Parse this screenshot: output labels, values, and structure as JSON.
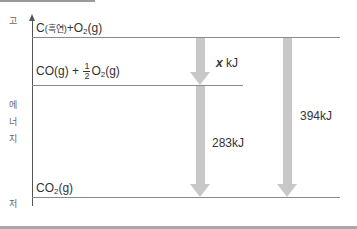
{
  "diagram": {
    "type": "energy_level_diagram",
    "y_axis": {
      "high_label": "고",
      "middle_label": [
        "에",
        "너",
        "지"
      ],
      "low_label": "저"
    },
    "levels": [
      {
        "id": "top",
        "species": "C",
        "species_note": "(흑연)",
        "plus": "+",
        "o2": "O",
        "o2_sub": "2",
        "state": "(g)"
      },
      {
        "id": "middle",
        "species": "CO(g)",
        "plus": "+",
        "frac_num": "1",
        "frac_den": "2",
        "o2": "O",
        "o2_sub": "2",
        "state": "(g)"
      },
      {
        "id": "bottom",
        "species": "CO",
        "sub": "2",
        "state": "(g)"
      }
    ],
    "arrows": [
      {
        "from": "top",
        "to": "middle",
        "var": "x",
        "unit": "kJ"
      },
      {
        "from": "middle",
        "to": "bottom",
        "label": "283kJ"
      },
      {
        "from": "top",
        "to": "bottom",
        "label": "394kJ"
      }
    ],
    "colors": {
      "arrow": "#c8c8c8",
      "line": "#8a8a8a",
      "axis": "#555555"
    }
  }
}
